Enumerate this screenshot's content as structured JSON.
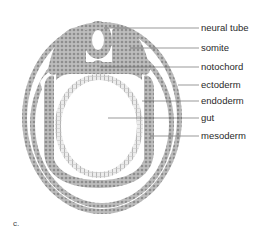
{
  "figure": {
    "panel_label": "c.",
    "labels": [
      {
        "text": "neural tube",
        "y": 28
      },
      {
        "text": "somite",
        "y": 48
      },
      {
        "text": "notochord",
        "y": 67
      },
      {
        "text": "ectoderm",
        "y": 85
      },
      {
        "text": "endoderm",
        "y": 101
      },
      {
        "text": "gut",
        "y": 118
      },
      {
        "text": "mesoderm",
        "y": 136
      }
    ]
  },
  "colors": {
    "tissue_fill": "#b5b5b5",
    "tissue_cells": "#8a8a8a",
    "endoderm_fill": "#e4e4e4",
    "line": "#555555",
    "text": "#2a2a2a"
  }
}
